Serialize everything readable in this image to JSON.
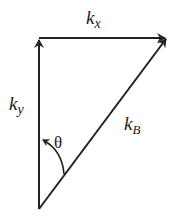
{
  "diagram": {
    "type": "vector-triangle",
    "stroke_color": "#222222",
    "background": "#ffffff",
    "vectors": [
      {
        "name": "k_y",
        "from": [
          39,
          209
        ],
        "to": [
          39,
          38
        ]
      },
      {
        "name": "k_x",
        "from": [
          39,
          38
        ],
        "to": [
          167,
          38
        ]
      },
      {
        "name": "k_B",
        "from": [
          39,
          209
        ],
        "to": [
          167,
          38
        ]
      }
    ],
    "angle": {
      "label": "θ",
      "between": [
        "k_y",
        "k_B"
      ],
      "arc_from": [
        64,
        173
      ],
      "arc_to": [
        41,
        140
      ]
    },
    "labels": {
      "kx": {
        "base": "k",
        "sub": "x"
      },
      "ky": {
        "base": "k",
        "sub": "y"
      },
      "kB": {
        "base": "k",
        "sub": "B"
      },
      "theta": "θ"
    }
  }
}
